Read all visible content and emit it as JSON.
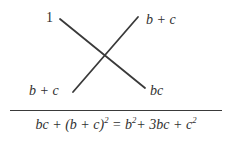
{
  "figure": {
    "kind": "cross-multiplication-factoring-diagram",
    "background_color": "#ffffff",
    "ink_color": "#2f2f2f"
  },
  "cross_diagram": {
    "name": "x-cross",
    "labels": {
      "top_left": "1",
      "top_right": "b + c",
      "bottom_left": "b + c",
      "bottom_right": "bc"
    },
    "lines": [
      {
        "name": "descending-stroke",
        "x1": 60,
        "y1": 19,
        "x2": 145,
        "y2": 88
      },
      {
        "name": "ascending-stroke",
        "x1": 73,
        "y1": 92,
        "x2": 138,
        "y2": 17
      }
    ],
    "stroke_color": "#3a3a3a",
    "stroke_width": 1.8
  },
  "divider": {
    "color": "#3a3a3a"
  },
  "equation": {
    "full_text": "bc + (b + c)² = b²+ 3bc + c²",
    "lhs_term_1": "bc",
    "plus_1": " + ",
    "lhs_group_open": "(",
    "lhs_group_body": "b + c",
    "lhs_group_close": ")",
    "lhs_exponent": "2",
    "equals": " = ",
    "rhs_term_1_base": "b",
    "rhs_term_1_exponent": "2",
    "plus_2": "+ ",
    "rhs_term_2": "3bc",
    "plus_3": " + ",
    "rhs_term_3_base": "c",
    "rhs_term_3_exponent": "2"
  }
}
